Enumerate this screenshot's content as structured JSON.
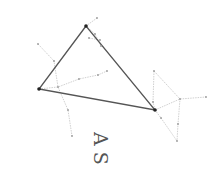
{
  "title": "A S",
  "colors": {
    "triangle": "#555555",
    "constellation": "#bbbbbb",
    "star": "#222222",
    "faint_star": "#999999"
  },
  "triangle": [
    [
      86,
      26
    ],
    [
      39,
      89
    ],
    [
      155,
      110
    ]
  ],
  "constellation_lines": [
    [
      [
        86,
        26
      ],
      [
        97,
        18
      ]
    ],
    [
      [
        86,
        26
      ],
      [
        95,
        34
      ],
      [
        101,
        46
      ]
    ],
    [
      [
        89,
        38
      ],
      [
        100,
        40
      ]
    ],
    [
      [
        38,
        44
      ],
      [
        54,
        61
      ],
      [
        58,
        87
      ],
      [
        68,
        110
      ],
      [
        72,
        136
      ]
    ],
    [
      [
        39,
        89
      ],
      [
        58,
        87
      ],
      [
        79,
        79
      ],
      [
        98,
        75
      ],
      [
        107,
        71
      ]
    ],
    [
      [
        154,
        71
      ],
      [
        153,
        102
      ],
      [
        155,
        110
      ]
    ],
    [
      [
        155,
        110
      ],
      [
        180,
        99
      ],
      [
        206,
        97
      ]
    ],
    [
      [
        154,
        71
      ],
      [
        180,
        99
      ],
      [
        178,
        124
      ],
      [
        177,
        141
      ]
    ],
    [
      [
        155,
        110
      ],
      [
        161,
        118
      ],
      [
        177,
        141
      ]
    ]
  ],
  "faint_stars": [
    [
      97,
      18
    ],
    [
      95,
      34
    ],
    [
      101,
      46
    ],
    [
      89,
      38
    ],
    [
      100,
      40
    ],
    [
      38,
      44
    ],
    [
      54,
      61
    ],
    [
      58,
      87
    ],
    [
      68,
      110
    ],
    [
      72,
      136
    ],
    [
      79,
      79
    ],
    [
      98,
      75
    ],
    [
      107,
      71
    ],
    [
      154,
      71
    ],
    [
      153,
      102
    ],
    [
      180,
      99
    ],
    [
      206,
      97
    ],
    [
      178,
      124
    ],
    [
      177,
      141
    ],
    [
      161,
      118
    ]
  ]
}
